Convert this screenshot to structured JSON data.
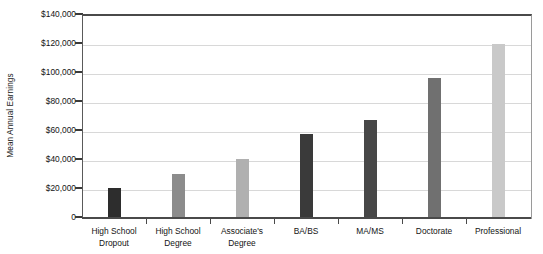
{
  "chart_data": {
    "type": "bar",
    "title": "",
    "xlabel": "",
    "ylabel": "Mean Annual Earnings",
    "ylim": [
      0,
      140000
    ],
    "grid": true,
    "legend": "none",
    "categories": [
      "High School\nDropout",
      "High School\nDegree",
      "Associate's\nDegree",
      "BA/BS",
      "MA/MS",
      "Doctorate",
      "Professional"
    ],
    "values": [
      20000,
      30000,
      40000,
      57000,
      67000,
      96000,
      119000
    ],
    "bar_colors": [
      "#2d2d2d",
      "#8c8c8c",
      "#b0b0b0",
      "#3a3a3a",
      "#474747",
      "#707070",
      "#c9c9c9"
    ],
    "y_ticks": [
      0,
      20000,
      40000,
      60000,
      80000,
      100000,
      120000,
      140000
    ],
    "y_tick_labels": [
      "0",
      "$20,000",
      "$40,000",
      "$60,000",
      "$80,000",
      "$100,000",
      "$120,000",
      "$140,000"
    ]
  },
  "axis": {
    "y_title": "Mean Annual Earnings"
  }
}
